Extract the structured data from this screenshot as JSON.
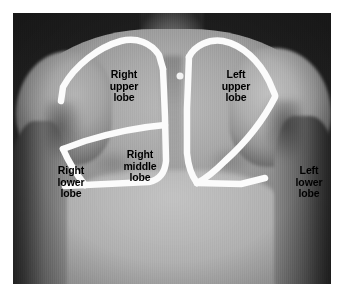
{
  "figure": {
    "kind": "anatomy-photograph",
    "frame": {
      "x": 13,
      "y": 13,
      "width": 318,
      "height": 271
    },
    "background_color": "#ffffff",
    "outline_color": "#fbfbfb",
    "label_color": "#000000"
  },
  "labels": {
    "right_upper_lobe": "Right\nupper\nlobe",
    "left_upper_lobe": "Left\nupper\nlobe",
    "right_middle_lobe": "Right\nmiddle\nlobe",
    "right_lower_lobe": "Right\nlower\nlobe",
    "left_lower_lobe": "Left\nlower\nlobe"
  },
  "markers": {
    "suprasternal_dot": {
      "x": 167,
      "y": 63,
      "radius": 3.5
    }
  }
}
